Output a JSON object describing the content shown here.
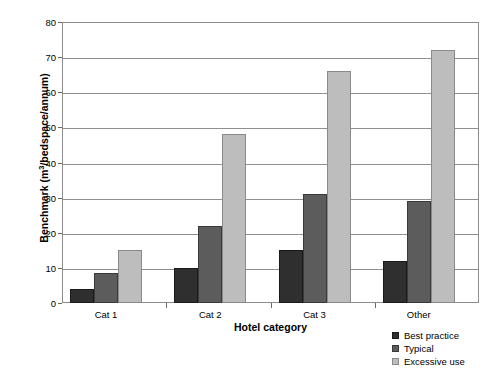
{
  "chart_data": {
    "type": "bar",
    "title": "",
    "subtitle": "",
    "xlabel": "Hotel category",
    "ylabel": "Benchmark (m³/bedspace/annum)",
    "ylabel_prefix": "Benchmark (m",
    "ylabel_superscript": "3",
    "ylabel_suffix": "/bedspace/annum)",
    "categories": [
      "Cat 1",
      "Cat 2",
      "Cat 3",
      "Other"
    ],
    "series": [
      {
        "name": "Best practice",
        "values": [
          4,
          10,
          15,
          12
        ],
        "color": "#2f2f2f"
      },
      {
        "name": "Typical",
        "values": [
          8.5,
          22,
          31,
          29
        ],
        "color": "#5c5c5c"
      },
      {
        "name": "Excessive use",
        "values": [
          15,
          48,
          66,
          72
        ],
        "color": "#bdbdbd"
      }
    ],
    "ylim": [
      0,
      80
    ],
    "yticks": [
      0,
      10,
      20,
      30,
      40,
      50,
      60,
      70,
      80
    ],
    "ytick_labels": [
      "0",
      "10",
      "20",
      "30",
      "40",
      "50",
      "60",
      "70",
      "80"
    ],
    "grid": true,
    "grid_axis": "y",
    "legend_position": "bottom-right",
    "legend_entries": [
      "Best practice",
      "Typical",
      "Excessive use"
    ],
    "frame_color": "#8c8c8c",
    "background": "#ffffff"
  }
}
